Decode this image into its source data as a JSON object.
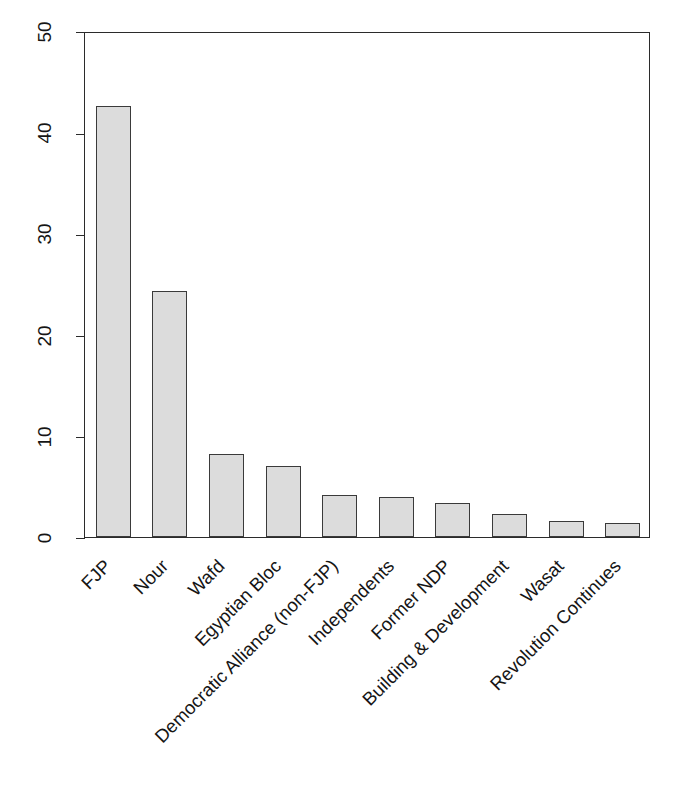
{
  "chart_data": {
    "type": "bar",
    "title": "",
    "xlabel": "",
    "ylabel": "Seats in Parliament (%)",
    "ylim": [
      0,
      50
    ],
    "yticks": [
      0,
      10,
      20,
      30,
      40,
      50
    ],
    "ytick_labels": [
      "0",
      "10",
      "20",
      "30",
      "40",
      "50"
    ],
    "grid": false,
    "legend": false,
    "bar_fill_color": "#dcdcdc",
    "bar_edge_color": "#3a3a3a",
    "axis_color": "#2b2b2b",
    "categories": [
      "FJP",
      "Nour",
      "Wafd",
      "Egyptian Bloc",
      "Democratic Alliance (non-FJP)",
      "Independents",
      "Former NDP",
      "Building & Development",
      "Wasat",
      "Revolution Continues"
    ],
    "values": [
      42.6,
      24.3,
      8.2,
      7.0,
      4.2,
      4.0,
      3.4,
      2.3,
      1.6,
      1.4
    ]
  }
}
